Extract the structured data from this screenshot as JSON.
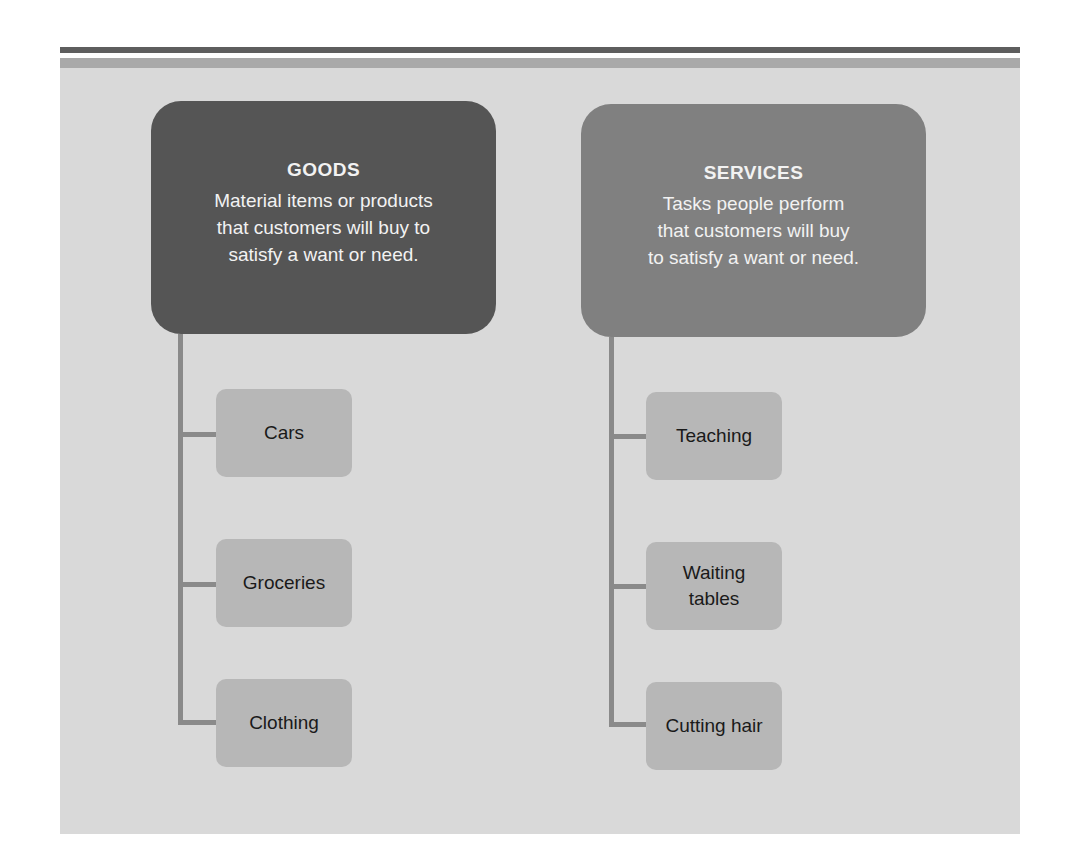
{
  "colors": {
    "page_background": "#ffffff",
    "panel_background": "#d9d9d9",
    "top_rule_dark": "#5e5e5e",
    "top_rule_mid": "#a9a9a9",
    "goods_header": "#555555",
    "services_header": "#808080",
    "item_box": "#b7b7b7",
    "connector": "#8a8a8a"
  },
  "goods": {
    "title": "GOODS",
    "description": "Material items or products\nthat customers will buy to\nsatisfy a want or need.",
    "items": [
      {
        "label": "Cars"
      },
      {
        "label": "Groceries"
      },
      {
        "label": "Clothing"
      }
    ]
  },
  "services": {
    "title": "SERVICES",
    "description": "Tasks people perform\nthat customers will buy\nto satisfy a want or need.",
    "items": [
      {
        "label": "Teaching"
      },
      {
        "label": "Waiting\ntables"
      },
      {
        "label": "Cutting hair"
      }
    ]
  }
}
